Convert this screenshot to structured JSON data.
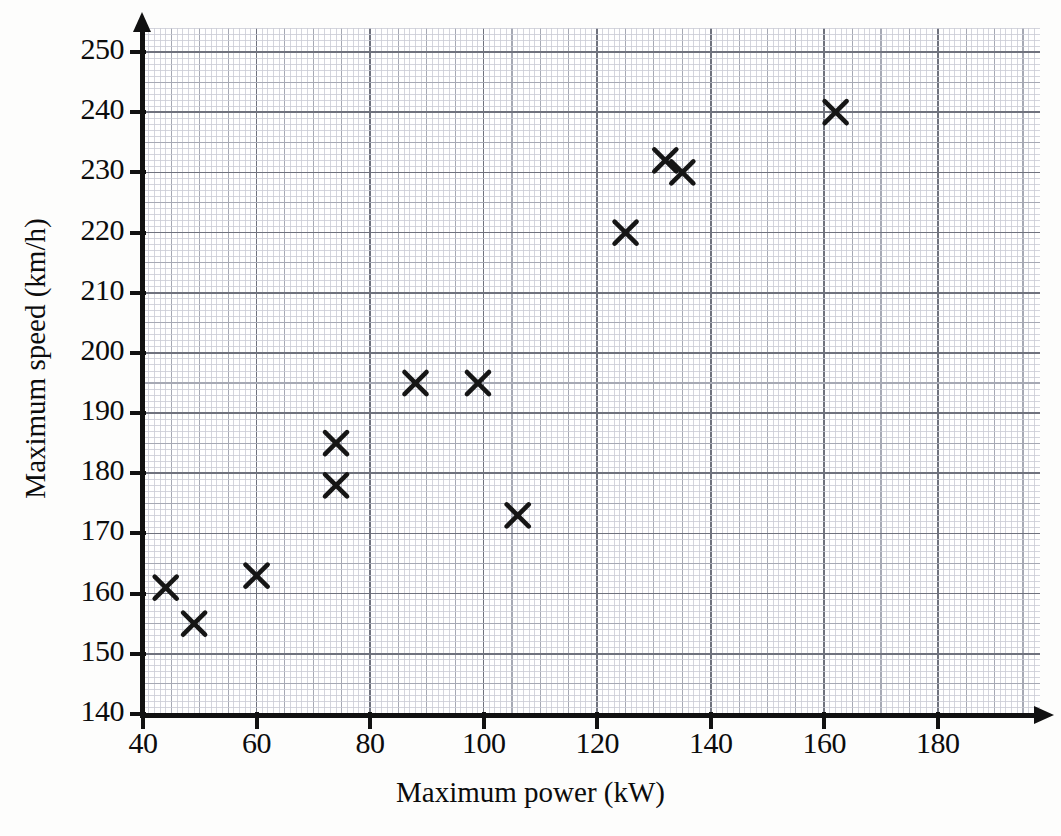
{
  "chart_data": {
    "type": "scatter",
    "title": "",
    "xlabel": "Maximum power (kW)",
    "ylabel": "Maximum speed (km/h)",
    "xlim": [
      40,
      198
    ],
    "ylim": [
      140,
      254
    ],
    "xticks": [
      40,
      60,
      80,
      100,
      120,
      140,
      160,
      180
    ],
    "xtick_labels": [
      "40",
      "60",
      "80",
      "100",
      "120",
      "140",
      "160",
      "180"
    ],
    "yticks": [
      140,
      150,
      160,
      170,
      180,
      190,
      200,
      210,
      220,
      230,
      240,
      250
    ],
    "ytick_labels": [
      "140",
      "150",
      "160",
      "170",
      "180",
      "190",
      "200",
      "210",
      "220",
      "230",
      "240",
      "250"
    ],
    "grid": true,
    "grid_style": "graph-paper",
    "minor_grid_step_x": 1,
    "minor_grid_step_y": 1,
    "medium_grid_step_x": 5,
    "medium_grid_step_y": 5,
    "major_grid_step_x": 20,
    "major_grid_step_y": 10,
    "legend": null,
    "marker": "x",
    "marker_color": "#151515",
    "points": [
      {
        "x": 44,
        "y": 161
      },
      {
        "x": 49,
        "y": 155
      },
      {
        "x": 60,
        "y": 163
      },
      {
        "x": 74,
        "y": 185
      },
      {
        "x": 74,
        "y": 178
      },
      {
        "x": 88,
        "y": 195
      },
      {
        "x": 99,
        "y": 195
      },
      {
        "x": 106,
        "y": 173
      },
      {
        "x": 125,
        "y": 220
      },
      {
        "x": 132,
        "y": 232
      },
      {
        "x": 135,
        "y": 230
      },
      {
        "x": 162,
        "y": 240
      }
    ]
  },
  "colors": {
    "ink": "#111111",
    "grid_minor": "#c9cbd4",
    "grid_medium": "#a6a9b4",
    "grid_major": "#6f727d",
    "paper": "#fdfdfc",
    "plot_background": "#ffffff"
  }
}
